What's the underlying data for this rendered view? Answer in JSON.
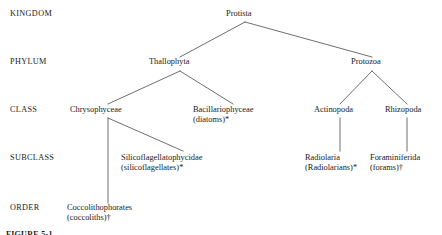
{
  "figure": {
    "caption": "FIGURE 5-1"
  },
  "ranks": [
    {
      "id": "kingdom",
      "label": "KINGDOM"
    },
    {
      "id": "phylum",
      "label": "PHYLUM"
    },
    {
      "id": "class",
      "label": "CLASS"
    },
    {
      "id": "subclass",
      "label": "SUBCLASS"
    },
    {
      "id": "order",
      "label": "ORDER"
    }
  ],
  "taxa": {
    "protista": {
      "name": "Protista",
      "common": ""
    },
    "thallophyta": {
      "name": "Thallophyta",
      "common": ""
    },
    "protozoa": {
      "name": "Protozoa",
      "common": ""
    },
    "chrysophyceae": {
      "name": "Chrysophyceae",
      "common": ""
    },
    "bacillariophyceae": {
      "name": "Bacillariophyceae",
      "common": "(diatoms)*"
    },
    "actinopoda": {
      "name": "Actinopoda",
      "common": ""
    },
    "rhizopoda": {
      "name": "Rhizopoda",
      "common": ""
    },
    "silicoflagellatophycidae": {
      "name": "Silicoflagellatophycidae",
      "common": "(silicoflagellates)*"
    },
    "radiolaria": {
      "name": "Radiolaria",
      "common": "(Radiolarians)*"
    },
    "foraminiferida": {
      "name": "Foraminiferida",
      "common": "(forams)†"
    },
    "coccolithophorates": {
      "name": "Coccolithophorates",
      "common": "(coccoliths)†"
    }
  },
  "style": {
    "line_color": "#4a4a4a",
    "text_color": "#1a1a1a",
    "background": "#ffffff"
  }
}
